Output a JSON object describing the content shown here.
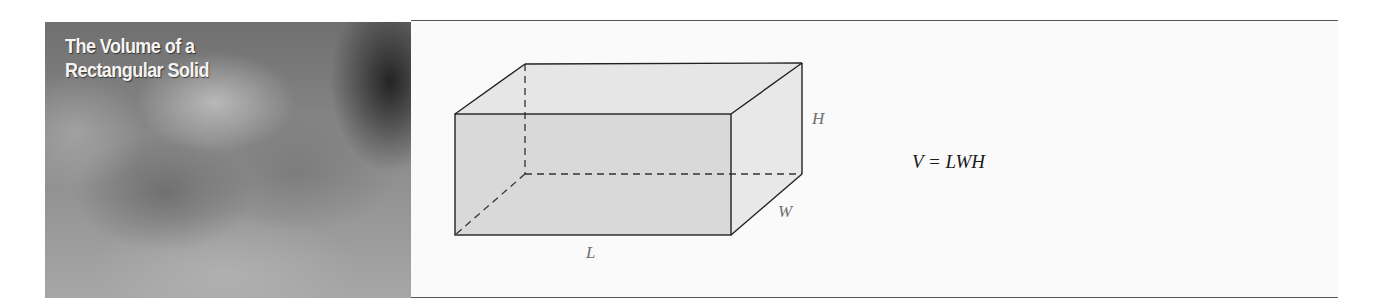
{
  "title_panel": {
    "title_line1": "The Volume of a",
    "title_line2": "Rectangular Solid"
  },
  "diagram": {
    "shape": "rectangular-solid",
    "labels": {
      "length": "L",
      "width": "W",
      "height": "H"
    },
    "colors": {
      "front_face": "#d9d9d9",
      "side_top_faces": "#e8e8e8",
      "edges": "#222222",
      "label_text": "#6e6e6e"
    }
  },
  "formula": {
    "text": "V = LWH"
  }
}
